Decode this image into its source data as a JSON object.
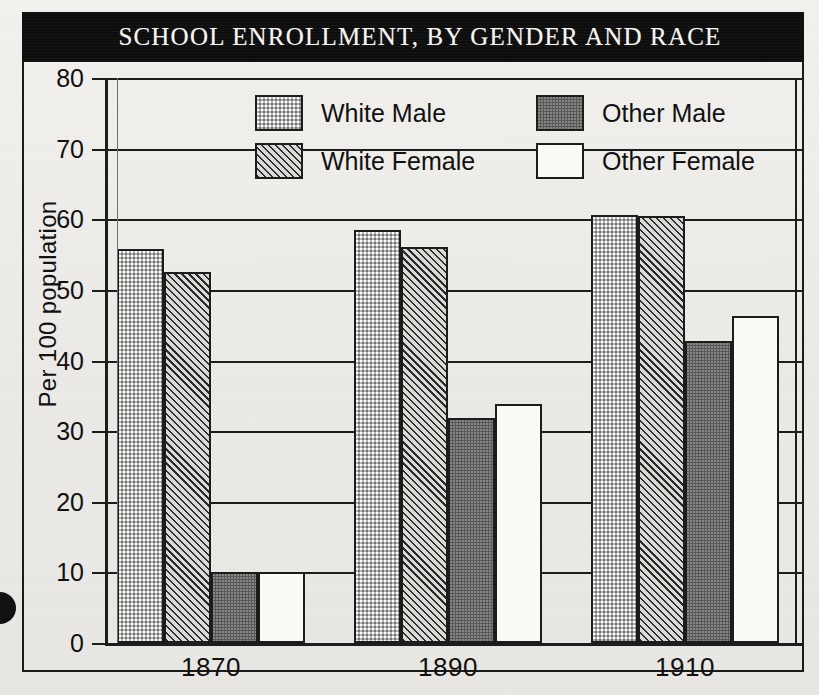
{
  "figure": {
    "title": "SCHOOL ENROLLMENT, BY GENDER AND RACE"
  },
  "legend": {
    "position": "upper-center",
    "items": [
      {
        "label": "White Male",
        "key": "white_male",
        "pattern": "light-gray-dotted",
        "color": "#b6b6b4"
      },
      {
        "label": "White Female",
        "key": "white_female",
        "pattern": "diagonal-hatch",
        "color": "#d9d9d6"
      },
      {
        "label": "Other Male",
        "key": "other_male",
        "pattern": "dark-gray-solid",
        "color": "#585856"
      },
      {
        "label": "Other Female",
        "key": "other_female",
        "pattern": "white-empty",
        "color": "#fbfaf7"
      }
    ]
  },
  "axes": {
    "ylabel": "Per 100 population",
    "yticks": [
      "80",
      "70",
      "60",
      "50",
      "40",
      "30",
      "20",
      "10",
      "0"
    ],
    "xticks": [
      "1870",
      "1890",
      "1910"
    ]
  },
  "chart_data": {
    "type": "bar",
    "title": "SCHOOL ENROLLMENT, BY GENDER AND RACE",
    "xlabel": "",
    "ylabel": "Per 100 population",
    "categories": [
      "1870",
      "1890",
      "1910"
    ],
    "ylim": [
      0,
      80
    ],
    "ytick_step": 10,
    "grid": "horizontal",
    "legend_position": "upper-center",
    "series": [
      {
        "name": "White Male",
        "values": [
          55.8,
          58.5,
          60.6
        ]
      },
      {
        "name": "White Female",
        "values": [
          52.5,
          56.1,
          60.4
        ]
      },
      {
        "name": "Other Male",
        "values": [
          10.0,
          31.9,
          42.8
        ]
      },
      {
        "name": "Other Female",
        "values": [
          10.0,
          33.8,
          46.3
        ]
      }
    ]
  },
  "colors": {
    "banner": "#0d0d0d",
    "banner_text": "#f6f4ef",
    "ink": "#1d1d1d",
    "paper": "#efefec"
  }
}
